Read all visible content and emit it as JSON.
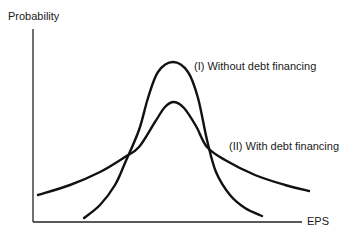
{
  "chart_data": {
    "type": "line",
    "title": "",
    "xlabel": "EPS",
    "ylabel": "Probability",
    "grid": false,
    "legend": "inline annotations",
    "series": [
      {
        "name": "(I) Without debt financing",
        "description": "Narrow, tall bell curve",
        "points": [
          [
            84,
            218
          ],
          [
            100,
            205
          ],
          [
            115,
            185
          ],
          [
            125,
            163
          ],
          [
            139,
            130
          ],
          [
            148,
            98
          ],
          [
            158,
            72
          ],
          [
            173,
            62
          ],
          [
            188,
            72
          ],
          [
            198,
            98
          ],
          [
            207,
            140
          ],
          [
            216,
            172
          ],
          [
            230,
            195
          ],
          [
            245,
            208
          ],
          [
            262,
            216
          ]
        ]
      },
      {
        "name": "(II) With debt financing",
        "description": "Wide, flatter bell curve",
        "points": [
          [
            38,
            195
          ],
          [
            70,
            185
          ],
          [
            100,
            172
          ],
          [
            125,
            157
          ],
          [
            139,
            147
          ],
          [
            155,
            122
          ],
          [
            165,
            107
          ],
          [
            174,
            102
          ],
          [
            184,
            108
          ],
          [
            196,
            126
          ],
          [
            207,
            147
          ],
          [
            225,
            160
          ],
          [
            255,
            175
          ],
          [
            285,
            185
          ],
          [
            309,
            191
          ]
        ]
      }
    ],
    "annotations": [
      {
        "text": "(I) Without debt financing",
        "x": 195,
        "y": 60
      },
      {
        "text": "(II) With debt financing",
        "x": 230,
        "y": 142
      }
    ]
  },
  "labels": {
    "y_axis": "Probability",
    "x_axis": "EPS",
    "curve_1": "(I) Without debt financing",
    "curve_2": "(II) With debt financing"
  }
}
